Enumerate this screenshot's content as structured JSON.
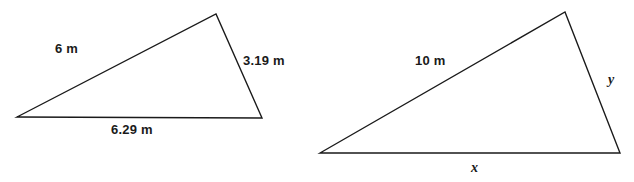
{
  "figure": {
    "background_color": "#ffffff",
    "stroke_color": "#1a1a1a",
    "stroke_width": 1.4
  },
  "triangles": [
    {
      "name": "left-triangle",
      "vertices": {
        "left": [
          17,
          117
        ],
        "apex": [
          216,
          14
        ],
        "right": [
          262,
          118
        ]
      },
      "labels": {
        "hypotenuse": "6 m",
        "right_side": "3.19 m",
        "base": "6.29 m"
      }
    },
    {
      "name": "right-triangle",
      "vertices": {
        "left": [
          320,
          153
        ],
        "apex": [
          565,
          12
        ],
        "right": [
          620,
          153
        ]
      },
      "labels": {
        "hypotenuse": "10 m",
        "right_side": "y",
        "base": "x"
      }
    }
  ]
}
